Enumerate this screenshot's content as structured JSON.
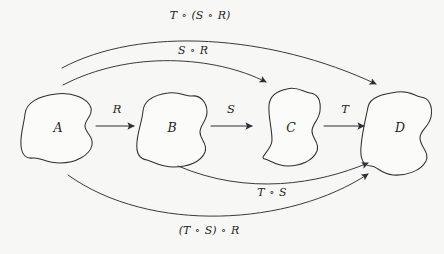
{
  "diagram": {
    "background_color": "#f7f7f6",
    "ink_color": "#2f2f33",
    "sets": [
      {
        "id": "A",
        "label": "A",
        "cx": 58,
        "cy": 127
      },
      {
        "id": "B",
        "label": "B",
        "cx": 172,
        "cy": 127
      },
      {
        "id": "C",
        "label": "C",
        "cx": 291,
        "cy": 127
      },
      {
        "id": "D",
        "label": "D",
        "cx": 400,
        "cy": 127
      }
    ],
    "direct_arrows": [
      {
        "id": "R",
        "label": "R",
        "from": "A",
        "to": "B",
        "label_x": 117,
        "label_y": 113
      },
      {
        "id": "S",
        "label": "S",
        "from": "B",
        "to": "C",
        "label_x": 231,
        "label_y": 113
      },
      {
        "id": "T",
        "label": "T",
        "from": "C",
        "to": "D",
        "label_x": 345,
        "label_y": 113
      }
    ],
    "composite_arcs": [
      {
        "id": "T_of_S_R",
        "label": "T ∘ (S ∘ R)",
        "parts": [
          "T",
          "∘",
          "(S",
          "∘",
          "R)"
        ],
        "from": "A",
        "to": "D",
        "side": "top",
        "label_x": 200,
        "label_y": 19
      },
      {
        "id": "S_R",
        "label": "S ∘ R",
        "parts": [
          "S",
          "∘",
          "R"
        ],
        "from": "A",
        "to": "C",
        "side": "top",
        "label_x": 193,
        "label_y": 54
      },
      {
        "id": "T_S",
        "label": "T ∘ S",
        "parts": [
          "T",
          "∘",
          "S"
        ],
        "from": "B",
        "to": "D",
        "side": "bottom",
        "label_x": 272,
        "label_y": 196
      },
      {
        "id": "TS_of_R",
        "label": "(T ∘ S) ∘ R",
        "parts": [
          "(T",
          "∘",
          "S)",
          "∘",
          "R"
        ],
        "from": "A",
        "to": "D",
        "side": "bottom",
        "label_x": 209,
        "label_y": 234
      }
    ]
  }
}
